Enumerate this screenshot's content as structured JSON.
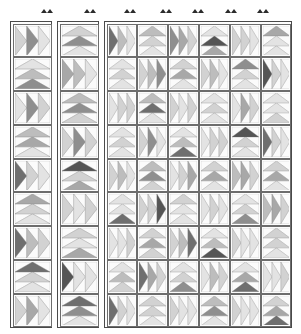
{
  "figure": {
    "kind": "quilt-pattern-grid",
    "columns": 8,
    "rows": 9,
    "palette": {
      "background": "#ffffff",
      "cell_fill": "#fcfcfc",
      "cell_border": "#6d6d6d",
      "panel_border": "#4a4a4a",
      "tick_color": "#2b2b2b",
      "shades": [
        "#f2f2f2",
        "#e3e3e3",
        "#d2d2d2",
        "#bdbdbd",
        "#a8a8a8",
        "#8f8f8f",
        "#6f6f6f",
        "#555555"
      ]
    },
    "tick_marks": {
      "count": 7,
      "label": "column-pair-marker",
      "x_positions": [
        41,
        84,
        124,
        160,
        192,
        225,
        257
      ]
    },
    "geometry": {
      "panel_groups": [
        {
          "name": "panel-col-1",
          "x": 10,
          "y": 21,
          "w": 42,
          "h": 307,
          "cols": 1
        },
        {
          "name": "panel-col-2",
          "x": 57,
          "y": 21,
          "w": 42,
          "h": 307,
          "cols": 1
        },
        {
          "name": "panel-cols-3-8",
          "x": 104,
          "y": 21,
          "w": 188,
          "h": 307,
          "cols": 6
        }
      ],
      "cell_w": 32,
      "cell_h": 33.5
    },
    "directions": [
      "right",
      "up",
      "left",
      "down"
    ],
    "grid": [
      [
        {
          "dir": "right",
          "shades": [
            2,
            5,
            1
          ]
        },
        {
          "dir": "up",
          "shades": [
            1,
            5,
            2
          ]
        },
        {
          "dir": "right",
          "shades": [
            6,
            3,
            1
          ]
        },
        {
          "dir": "up",
          "shades": [
            1,
            2,
            3
          ]
        },
        {
          "dir": "right",
          "shades": [
            5,
            4,
            2
          ]
        },
        {
          "dir": "up",
          "shades": [
            4,
            7,
            1
          ]
        },
        {
          "dir": "right",
          "shades": [
            2,
            2,
            1
          ]
        },
        {
          "dir": "up",
          "shades": [
            1,
            1,
            4
          ]
        }
      ],
      [
        {
          "dir": "up",
          "shades": [
            5,
            3,
            1
          ]
        },
        {
          "dir": "right",
          "shades": [
            4,
            3,
            1
          ]
        },
        {
          "dir": "up",
          "shades": [
            1,
            2,
            1
          ]
        },
        {
          "dir": "right",
          "shades": [
            2,
            3,
            5
          ]
        },
        {
          "dir": "up",
          "shades": [
            1,
            4,
            2
          ]
        },
        {
          "dir": "right",
          "shades": [
            2,
            3,
            1
          ]
        },
        {
          "dir": "up",
          "shades": [
            1,
            2,
            5
          ]
        },
        {
          "dir": "right",
          "shades": [
            7,
            2,
            1
          ]
        }
      ],
      [
        {
          "dir": "right",
          "shades": [
            1,
            5,
            2
          ]
        },
        {
          "dir": "up",
          "shades": [
            2,
            5,
            3
          ]
        },
        {
          "dir": "right",
          "shades": [
            1,
            2,
            2
          ]
        },
        {
          "dir": "up",
          "shades": [
            1,
            6,
            3
          ]
        },
        {
          "dir": "right",
          "shades": [
            2,
            1,
            2
          ]
        },
        {
          "dir": "up",
          "shades": [
            1,
            2,
            1
          ]
        },
        {
          "dir": "right",
          "shades": [
            1,
            4,
            2
          ]
        },
        {
          "dir": "up",
          "shades": [
            2,
            1,
            1
          ]
        }
      ],
      [
        {
          "dir": "up",
          "shades": [
            1,
            4,
            3
          ]
        },
        {
          "dir": "right",
          "shades": [
            2,
            5,
            2
          ]
        },
        {
          "dir": "up",
          "shades": [
            1,
            2,
            1
          ]
        },
        {
          "dir": "right",
          "shades": [
            2,
            5,
            1
          ]
        },
        {
          "dir": "up",
          "shades": [
            6,
            3,
            1
          ]
        },
        {
          "dir": "right",
          "shades": [
            1,
            2,
            2
          ]
        },
        {
          "dir": "up",
          "shades": [
            1,
            2,
            7
          ]
        },
        {
          "dir": "right",
          "shades": [
            6,
            2,
            1
          ]
        }
      ],
      [
        {
          "dir": "right",
          "shades": [
            6,
            2,
            1
          ]
        },
        {
          "dir": "up",
          "shades": [
            4,
            2,
            7
          ]
        },
        {
          "dir": "right",
          "shades": [
            2,
            3,
            1
          ]
        },
        {
          "dir": "up",
          "shades": [
            2,
            5,
            3
          ]
        },
        {
          "dir": "right",
          "shades": [
            1,
            2,
            4
          ]
        },
        {
          "dir": "up",
          "shades": [
            1,
            4,
            2
          ]
        },
        {
          "dir": "right",
          "shades": [
            3,
            4,
            2
          ]
        },
        {
          "dir": "up",
          "shades": [
            1,
            4,
            2
          ]
        }
      ],
      [
        {
          "dir": "up",
          "shades": [
            1,
            2,
            4
          ]
        },
        {
          "dir": "right",
          "shades": [
            2,
            1,
            2
          ]
        },
        {
          "dir": "up",
          "shades": [
            6,
            1,
            1
          ]
        },
        {
          "dir": "right",
          "shades": [
            2,
            2,
            7
          ]
        },
        {
          "dir": "up",
          "shades": [
            1,
            1,
            2
          ]
        },
        {
          "dir": "right",
          "shades": [
            1,
            2,
            1
          ]
        },
        {
          "dir": "up",
          "shades": [
            5,
            2,
            1
          ]
        },
        {
          "dir": "right",
          "shades": [
            3,
            4,
            2
          ]
        }
      ],
      [
        {
          "dir": "right",
          "shades": [
            6,
            3,
            2
          ]
        },
        {
          "dir": "up",
          "shades": [
            4,
            1,
            2
          ]
        },
        {
          "dir": "right",
          "shades": [
            1,
            1,
            2
          ]
        },
        {
          "dir": "up",
          "shades": [
            2,
            4,
            2
          ]
        },
        {
          "dir": "right",
          "shades": [
            2,
            3,
            6
          ]
        },
        {
          "dir": "up",
          "shades": [
            7,
            3,
            1
          ]
        },
        {
          "dir": "right",
          "shades": [
            2,
            1,
            1
          ]
        },
        {
          "dir": "up",
          "shades": [
            1,
            2,
            2
          ]
        }
      ],
      [
        {
          "dir": "up",
          "shades": [
            1,
            2,
            6
          ]
        },
        {
          "dir": "right",
          "shades": [
            7,
            1,
            1
          ]
        },
        {
          "dir": "up",
          "shades": [
            2,
            3,
            1
          ]
        },
        {
          "dir": "right",
          "shades": [
            6,
            4,
            2
          ]
        },
        {
          "dir": "up",
          "shades": [
            5,
            2,
            1
          ]
        },
        {
          "dir": "right",
          "shades": [
            1,
            3,
            2
          ]
        },
        {
          "dir": "up",
          "shades": [
            6,
            4,
            1
          ]
        },
        {
          "dir": "right",
          "shades": [
            1,
            1,
            2
          ]
        }
      ],
      [
        {
          "dir": "right",
          "shades": [
            2,
            4,
            1
          ]
        },
        {
          "dir": "up",
          "shades": [
            1,
            5,
            6
          ]
        },
        {
          "dir": "right",
          "shades": [
            6,
            2,
            1
          ]
        },
        {
          "dir": "up",
          "shades": [
            1,
            2,
            2
          ]
        },
        {
          "dir": "right",
          "shades": [
            2,
            1,
            1
          ]
        },
        {
          "dir": "up",
          "shades": [
            1,
            5,
            3
          ]
        },
        {
          "dir": "right",
          "shades": [
            2,
            1,
            1
          ]
        },
        {
          "dir": "up",
          "shades": [
            6,
            4,
            2
          ]
        }
      ]
    ]
  }
}
